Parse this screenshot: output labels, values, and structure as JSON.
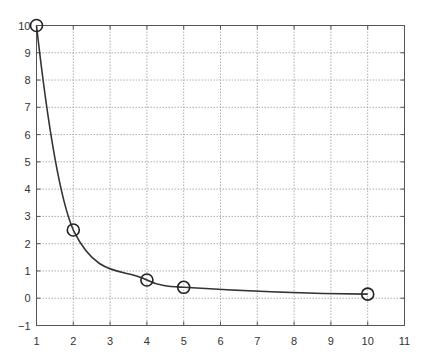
{
  "chart_data": {
    "type": "line",
    "title": "",
    "xlabel": "",
    "ylabel": "",
    "x": [
      1,
      2,
      4,
      5,
      10
    ],
    "series": [
      {
        "name": "data",
        "values": [
          10,
          2.5,
          0.67,
          0.4,
          0.15
        ],
        "marker": "circle",
        "line": "smooth",
        "color": "#333333"
      }
    ],
    "xlim": [
      1,
      11
    ],
    "ylim": [
      -1,
      10
    ],
    "xticks": [
      "1",
      "2",
      "3",
      "4",
      "5",
      "6",
      "7",
      "8",
      "9",
      "10",
      "11"
    ],
    "yticks": [
      "-1",
      "0",
      "1",
      "2",
      "3",
      "4",
      "5",
      "6",
      "7",
      "8",
      "9",
      "10"
    ],
    "grid": true,
    "legend": null
  },
  "colors": {
    "line": "#333333",
    "grid": "#9a9a9a",
    "frame": "#555555",
    "text": "#333333"
  }
}
